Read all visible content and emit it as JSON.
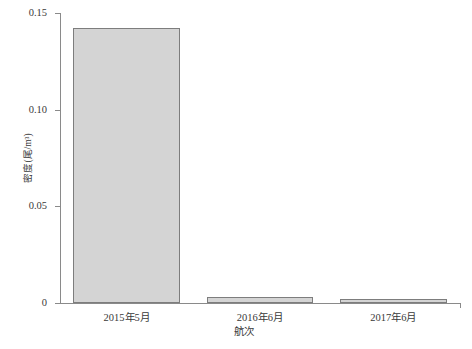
{
  "chart_data": {
    "type": "bar",
    "title": "",
    "subtitle": "",
    "xlabel": "航次",
    "ylabel": "密度(尾/m³)",
    "categories": [
      "2015年5月",
      "2016年6月",
      "2017年6月"
    ],
    "values": [
      0.142,
      0.003,
      0.002
    ],
    "series": [
      {
        "name": "密度",
        "values": [
          0.142,
          0.003,
          0.002
        ]
      }
    ],
    "ylim": [
      0,
      0.15
    ],
    "yticks": [
      0,
      0.05,
      0.1,
      0.15
    ],
    "ytick_labels": [
      "0",
      "0.05",
      "0.10",
      "0.15"
    ],
    "grid": false,
    "legend": false,
    "legend_position": "none",
    "bar_fill_color": "#d4d4d4",
    "bar_edge_color": "#7d7d7d",
    "axis_color": "#8a8a8a",
    "background_color": "#ffffff"
  },
  "axes": {
    "y_title": "密度(尾/m³)",
    "x_title": "航次",
    "y_tick_labels": [
      "0.15",
      "0.10",
      "0.05",
      "0"
    ],
    "x_tick_labels": [
      "2015年5月",
      "2016年6月",
      "2017年6月"
    ]
  }
}
